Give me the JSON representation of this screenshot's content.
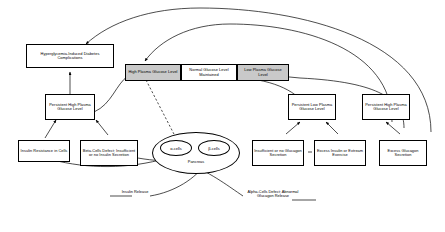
{
  "diagram": {
    "nodes": {
      "hyperglycemia_complications": "Hyperglycemia-Induced Diabetes Complications",
      "persistent_high_left": "Persistent High Plasma Glucose Level",
      "insulin_resistance": "Insulin Resistance in Cells",
      "beta_cell_defect": "Beta-Cells Defect; Insufficient or no Insulin Secretion",
      "high_plasma": "High Plasma Glucose Level",
      "normal_glucose": "Normal Glucose Level Maintained",
      "low_plasma": "Low Plasma Glucose Level",
      "persistent_low_right": "Persistent Low Plasma Glucose Level",
      "persistent_high_right": "Persistent High Plasma Glucose Level",
      "insufficient_glucagon": "Insufficient or no Glucagon Secretion",
      "excess_insulin": "Excess Insulin or Extream Exercise",
      "excess_glucagon": "Excess Glucagon Secretion"
    },
    "organ": {
      "pancreas_label": "Pancreas",
      "alpha_cells": "α-cells",
      "beta_cells": "β-cells"
    },
    "edge_labels": {
      "insulin_release": "Insulin Release",
      "alpha_defect": "Alpha-Cells Defect; Abnormal Glucagon Release"
    },
    "colors": {
      "stroke": "#000000",
      "shaded_fill": "#c9c9c9",
      "plain_fill": "#ffffff",
      "background": "#ffffff"
    }
  }
}
